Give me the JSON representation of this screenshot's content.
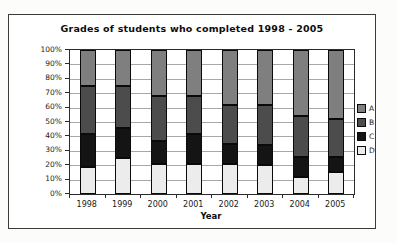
{
  "chart_data": {
    "type": "bar",
    "stacked": true,
    "percent_stacked": true,
    "title": "Grades of students who completed 1998 - 2005",
    "xlabel": "Year",
    "ylabel": "",
    "categories": [
      "1998",
      "1999",
      "2000",
      "2001",
      "2002",
      "2003",
      "2004",
      "2005"
    ],
    "series": [
      {
        "name": "A",
        "color": "#7f7f7f",
        "values": [
          25,
          25,
          32,
          32,
          38,
          38,
          46,
          48
        ]
      },
      {
        "name": "B",
        "color": "#4c4c4c",
        "values": [
          33,
          29,
          31,
          26,
          27,
          28,
          28,
          26
        ]
      },
      {
        "name": "C",
        "color": "#141414",
        "values": [
          23,
          21,
          16,
          21,
          14,
          14,
          14,
          11
        ]
      },
      {
        "name": "D",
        "color": "#ececec",
        "values": [
          19,
          25,
          21,
          21,
          21,
          20,
          12,
          15
        ]
      }
    ],
    "stack_order_bottom_to_top": [
      "D",
      "C",
      "B",
      "A"
    ],
    "ylim": [
      0,
      100
    ],
    "ytick_step": 10,
    "ytick_labels": [
      "0%",
      "10%",
      "20%",
      "30%",
      "40%",
      "50%",
      "60%",
      "70%",
      "80%",
      "90%",
      "100%"
    ],
    "grid": true,
    "legend_position": "right",
    "legend_order": [
      "A",
      "B",
      "C",
      "D"
    ]
  }
}
